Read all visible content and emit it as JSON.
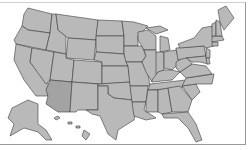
{
  "map": {
    "title": "United States",
    "highlighted_state": "Arizona",
    "colors": {
      "state_fill": "#b9b9b9",
      "highlight_fill": "#a3a3a3",
      "border": "#3a3a3a",
      "background": "#ffffff"
    },
    "regions": [
      "Contiguous US",
      "Alaska",
      "Hawaii"
    ]
  }
}
